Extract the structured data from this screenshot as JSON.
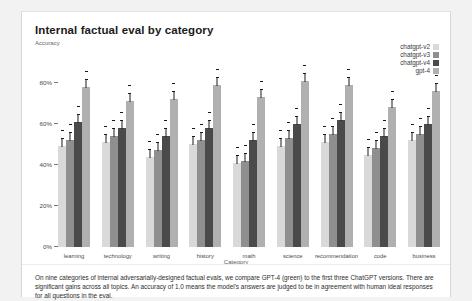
{
  "figure": {
    "title": "Internal factual eval by category",
    "subtitle": "Accuracy",
    "caption": "On nine categories of internal adversarially-designed factual evals, we compare GPT-4 (green) to the first three ChatGPT versions. There are significant gains across all topics. An accuracy of 1.0 means the model's answers are judged to be in agreement with human ideal responses for all questions in the eval."
  },
  "chart_data": {
    "type": "bar",
    "title": "Internal factual eval by category",
    "subtitle": "Accuracy",
    "xlabel": "Category",
    "ylabel": "Accuracy",
    "categories": [
      "learning",
      "technology",
      "writing",
      "history",
      "math",
      "science",
      "recommendation",
      "code",
      "business"
    ],
    "ytick_labels": [
      "0%",
      "20%",
      "40%",
      "60%",
      "80%"
    ],
    "ytick_values": [
      0,
      20,
      40,
      60,
      80
    ],
    "ylim": [
      0,
      90
    ],
    "grid": false,
    "legend_position": "top-right",
    "error_bars": true,
    "series": [
      {
        "name": "chatgpt-v2",
        "color": "#d9d9d9",
        "values": [
          49,
          51,
          44,
          50,
          41,
          49,
          51,
          45,
          52
        ]
      },
      {
        "name": "chatgpt-v3",
        "color": "#8f8f8f",
        "values": [
          52,
          54,
          47,
          52,
          42,
          53,
          55,
          48,
          55
        ]
      },
      {
        "name": "chatgpt-v4",
        "color": "#4a4a4a",
        "values": [
          61,
          58,
          54,
          58,
          52,
          60,
          62,
          54,
          60
        ]
      },
      {
        "name": "gpt-4",
        "color": "#b0b0b0",
        "values": [
          78,
          71,
          72,
          79,
          73,
          81,
          79,
          68,
          76
        ]
      }
    ]
  }
}
